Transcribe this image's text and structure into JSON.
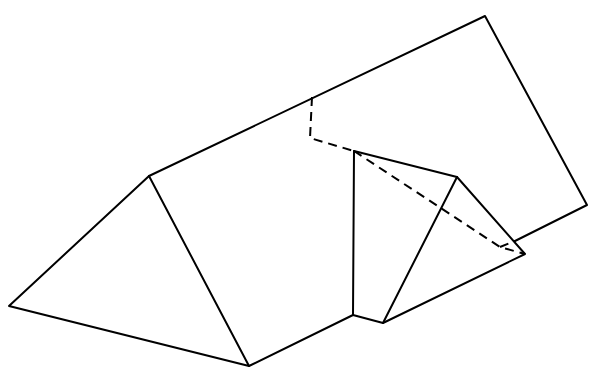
{
  "diagram": {
    "title": "",
    "stroke_color": "#000000",
    "background": "#ffffff",
    "solid_edges": [
      {
        "name": "left-triangle",
        "points": [
          [
            9,
            306
          ],
          [
            149,
            176
          ],
          [
            249,
            366
          ]
        ],
        "closed": true
      },
      {
        "name": "prism-bottom-edge",
        "points": [
          [
            249,
            366
          ],
          [
            353,
            315
          ]
        ]
      },
      {
        "name": "plane-top-edge",
        "points": [
          [
            149,
            176
          ],
          [
            485,
            16
          ],
          [
            587,
            205
          ],
          [
            515,
            241
          ]
        ]
      },
      {
        "name": "vertical-edge",
        "points": [
          [
            353,
            315
          ],
          [
            354,
            151
          ]
        ]
      },
      {
        "name": "small-triangle",
        "points": [
          [
            354,
            151
          ],
          [
            457,
            177
          ],
          [
            525,
            254
          ],
          [
            383,
            323
          ],
          [
            353,
            315
          ]
        ]
      },
      {
        "name": "small-triangle-inner",
        "points": [
          [
            457,
            177
          ],
          [
            383,
            323
          ]
        ]
      }
    ],
    "dashed_edges": [
      {
        "name": "hidden-bend",
        "points": [
          [
            312,
            97
          ],
          [
            310,
            138
          ],
          [
            354,
            151
          ]
        ]
      },
      {
        "name": "hidden-diagonal",
        "points": [
          [
            354,
            151
          ],
          [
            500,
            247
          ],
          [
            525,
            254
          ]
        ]
      },
      {
        "name": "hidden-plane-edge",
        "points": [
          [
            500,
            247
          ],
          [
            515,
            241
          ]
        ]
      }
    ]
  }
}
